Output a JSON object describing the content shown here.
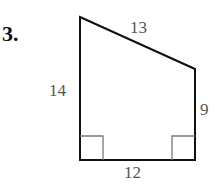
{
  "problem": {
    "number": "3."
  },
  "figure": {
    "shape": "right trapezoid",
    "vertices": [
      [
        80,
        17
      ],
      [
        195,
        69
      ],
      [
        195,
        160
      ],
      [
        80,
        160
      ]
    ],
    "labels": {
      "top_slant": "13",
      "left_side": "14",
      "right_side": "9",
      "bottom_side": "12"
    },
    "right_angles": [
      "bottom-left",
      "bottom-right"
    ],
    "colors": {
      "stroke": "#111111",
      "marker": "#777777",
      "label": "#555555"
    }
  }
}
